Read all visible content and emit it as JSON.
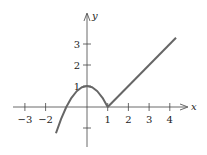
{
  "chart_data": {
    "type": "line",
    "title": "",
    "xlabel": "x",
    "ylabel": "y",
    "xlim": [
      -3.6,
      4.6
    ],
    "ylim": [
      -1.6,
      4.0
    ],
    "grid": false,
    "x_ticks": [
      -3,
      -2,
      1,
      2,
      3,
      4
    ],
    "x_tick_labels": [
      "−3",
      "−2",
      "1",
      "2",
      "3",
      "4"
    ],
    "y_ticks": [
      1,
      2,
      3,
      -1
    ],
    "y_tick_labels": [
      "1",
      "2",
      "3",
      ""
    ],
    "series": [
      {
        "name": "f(x) = 1 − x², x ≤ 1",
        "x": [
          -1.5,
          -1.25,
          -1,
          -0.75,
          -0.5,
          -0.25,
          0,
          0.25,
          0.5,
          0.75,
          1
        ],
        "y": [
          -1.25,
          -0.5625,
          0,
          0.4375,
          0.75,
          0.9375,
          1,
          0.9375,
          0.75,
          0.4375,
          0
        ]
      },
      {
        "name": "f(x) = x − 1, x ≥ 1",
        "x": [
          1,
          4.3
        ],
        "y": [
          0,
          3.3
        ]
      }
    ],
    "color": "#666666"
  }
}
